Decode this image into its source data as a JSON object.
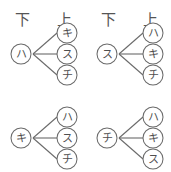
{
  "figure": {
    "top_cropped_text": "",
    "stroke_color": "#6a6a6a",
    "text_color": "#4f4f4f",
    "background_color": "#ffffff"
  },
  "headers": {
    "left_label": "下",
    "right_label": "上"
  },
  "trees": [
    {
      "id": "tree-1",
      "show_headers": true,
      "root": "ハ",
      "leaves": [
        "キ",
        "ス",
        "チ"
      ]
    },
    {
      "id": "tree-2",
      "show_headers": true,
      "root": "ス",
      "leaves": [
        "ハ",
        "キ",
        "チ"
      ]
    },
    {
      "id": "tree-3",
      "show_headers": false,
      "root": "キ",
      "leaves": [
        "ハ",
        "ス",
        "チ"
      ]
    },
    {
      "id": "tree-4",
      "show_headers": false,
      "root": "チ",
      "leaves": [
        "ハ",
        "キ",
        "ス"
      ]
    }
  ]
}
